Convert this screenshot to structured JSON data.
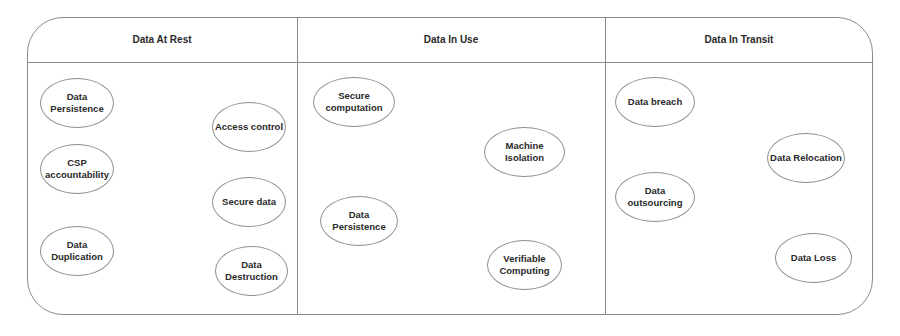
{
  "diagram": {
    "columns": [
      {
        "title": "Data At Rest",
        "items": [
          {
            "label": "Data\nPersistence",
            "x": 40,
            "y": 78,
            "w": 74,
            "h": 50
          },
          {
            "label": "Access control",
            "x": 212,
            "y": 102,
            "w": 74,
            "h": 50
          },
          {
            "label": "CSP\naccountability",
            "x": 40,
            "y": 144,
            "w": 74,
            "h": 50
          },
          {
            "label": "Secure data",
            "x": 212,
            "y": 177,
            "w": 74,
            "h": 50
          },
          {
            "label": "Data\nDuplication",
            "x": 40,
            "y": 226,
            "w": 74,
            "h": 50
          },
          {
            "label": "Data\nDestruction",
            "x": 215,
            "y": 246,
            "w": 73,
            "h": 50
          }
        ]
      },
      {
        "title": "Data In Use",
        "items": [
          {
            "label": "Secure\ncomputation",
            "x": 313,
            "y": 77,
            "w": 82,
            "h": 50
          },
          {
            "label": "Machine\nIsolation",
            "x": 484,
            "y": 127,
            "w": 81,
            "h": 50
          },
          {
            "label": "Data\nPersistence",
            "x": 320,
            "y": 196,
            "w": 78,
            "h": 50
          },
          {
            "label": "Verifiable\nComputing",
            "x": 487,
            "y": 240,
            "w": 75,
            "h": 50
          }
        ]
      },
      {
        "title": "Data In Transit",
        "items": [
          {
            "label": "Data breach",
            "x": 615,
            "y": 77,
            "w": 80,
            "h": 50
          },
          {
            "label": "Data Relocation",
            "x": 767,
            "y": 133,
            "w": 78,
            "h": 50
          },
          {
            "label": "Data\noutsourcing",
            "x": 615,
            "y": 172,
            "w": 80,
            "h": 50
          },
          {
            "label": "Data Loss",
            "x": 775,
            "y": 233,
            "w": 77,
            "h": 50
          }
        ]
      }
    ]
  }
}
